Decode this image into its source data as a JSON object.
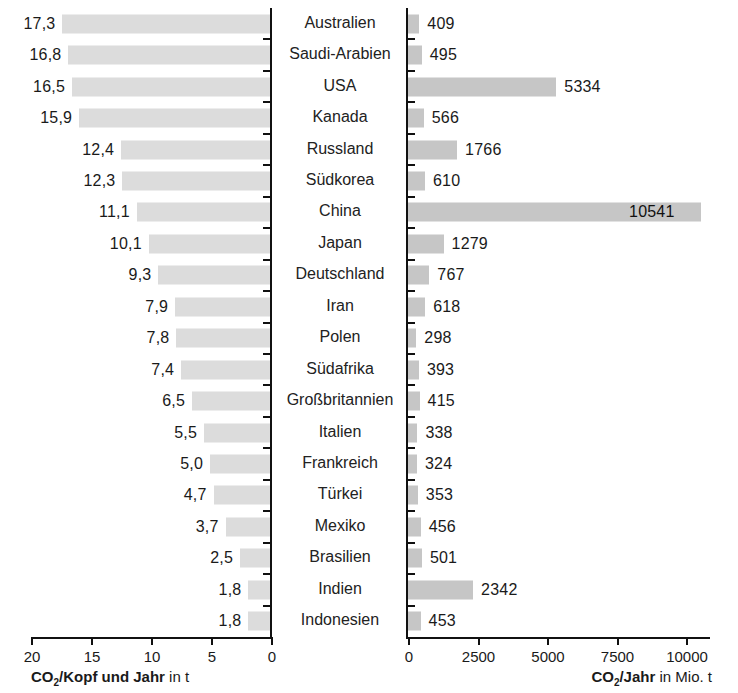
{
  "chart_data": {
    "type": "bar",
    "orientation": "horizontal",
    "layout": "butterfly-diverging-pair",
    "title": "",
    "categories": [
      "Australien",
      "Saudi-Arabien",
      "USA",
      "Kanada",
      "Russland",
      "Südkorea",
      "China",
      "Japan",
      "Deutschland",
      "Iran",
      "Polen",
      "Südafrika",
      "Großbritannien",
      "Italien",
      "Frankreich",
      "Türkei",
      "Mexiko",
      "Brasilien",
      "Indien",
      "Indonesien"
    ],
    "series": [
      {
        "name": "CO2/Kopf und Jahr in t",
        "side": "left",
        "unit": "t",
        "axis_label": "CO₂/Kopf und Jahr in t",
        "axis_label_bold": "CO₂/Kopf und Jahr",
        "axis_label_tail": "in t",
        "direction": "right-to-left",
        "xlim": [
          0,
          20
        ],
        "ticks": [
          20,
          15,
          10,
          5,
          0
        ],
        "tick_labels": [
          "20",
          "15",
          "10",
          "5",
          "0"
        ],
        "values": [
          17.3,
          16.8,
          16.5,
          15.9,
          12.4,
          12.3,
          11.1,
          10.1,
          9.3,
          7.9,
          7.8,
          7.4,
          6.5,
          5.5,
          5.0,
          4.7,
          3.7,
          2.5,
          1.8,
          1.8
        ],
        "value_labels": [
          "17,3",
          "16,8",
          "16,5",
          "15,9",
          "12,4",
          "12,3",
          "11,1",
          "10,1",
          "9,3",
          "7,9",
          "7,8",
          "7,4",
          "6,5",
          "5,5",
          "5,0",
          "4,7",
          "3,7",
          "2,5",
          "1,8",
          "1,8"
        ],
        "bar_color": "#dcdcdc"
      },
      {
        "name": "CO2/Jahr in Mio. t",
        "side": "right",
        "unit": "Mio. t",
        "axis_label": "CO₂/Jahr in Mio. t",
        "axis_label_bold": "CO₂/Jahr",
        "axis_label_tail": "in Mio. t",
        "direction": "left-to-right",
        "xlim": [
          0,
          11000
        ],
        "ticks": [
          0,
          2500,
          5000,
          7500,
          10000
        ],
        "tick_labels": [
          "0",
          "2500",
          "5000",
          "7500",
          "10000"
        ],
        "values": [
          409,
          495,
          5334,
          566,
          1766,
          610,
          10541,
          1279,
          767,
          618,
          298,
          393,
          415,
          338,
          324,
          353,
          456,
          501,
          2342,
          453
        ],
        "value_labels": [
          "409",
          "495",
          "5334",
          "566",
          "1766",
          "610",
          "10541",
          "1279",
          "767",
          "618",
          "298",
          "393",
          "415",
          "338",
          "324",
          "353",
          "456",
          "501",
          "2342",
          "453"
        ],
        "bar_color": "#c6c6c6"
      }
    ],
    "grid": false,
    "legend": "none",
    "axis_color": "#111111",
    "background": "#ffffff"
  }
}
